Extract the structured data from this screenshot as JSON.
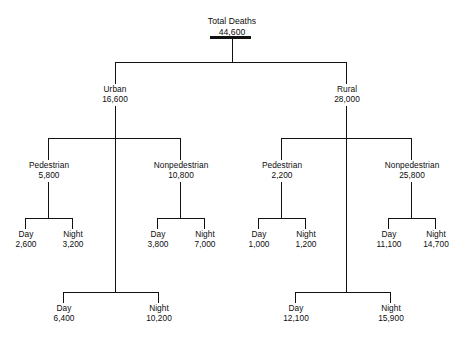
{
  "diagram": {
    "type": "hierarchy-tree",
    "title_node": {
      "label": "Total Deaths",
      "value": "44,600"
    },
    "level2": [
      {
        "label": "Urban",
        "value": "16,600"
      },
      {
        "label": "Rural",
        "value": "28,000"
      }
    ],
    "level3": [
      {
        "label": "Pedestrian",
        "value": "5,800"
      },
      {
        "label": "Nonpedestrian",
        "value": "10,800"
      },
      {
        "label": "Pedestrian",
        "value": "2,200"
      },
      {
        "label": "Nonpedestrian",
        "value": "25,800"
      }
    ],
    "level4": [
      {
        "label": "Day",
        "value": "2,600"
      },
      {
        "label": "Night",
        "value": "3,200"
      },
      {
        "label": "Day",
        "value": "3,800"
      },
      {
        "label": "Night",
        "value": "7,000"
      },
      {
        "label": "Day",
        "value": "1,000"
      },
      {
        "label": "Night",
        "value": "1,200"
      },
      {
        "label": "Day",
        "value": "11,100"
      },
      {
        "label": "Night",
        "value": "14,700"
      }
    ],
    "summary": [
      {
        "label": "Day",
        "value": "6,400"
      },
      {
        "label": "Night",
        "value": "10,200"
      },
      {
        "label": "Day",
        "value": "12,100"
      },
      {
        "label": "Night",
        "value": "15,900"
      }
    ],
    "colors": {
      "background": "#ffffff",
      "line": "#111111",
      "text": "#0d0d0d"
    }
  }
}
